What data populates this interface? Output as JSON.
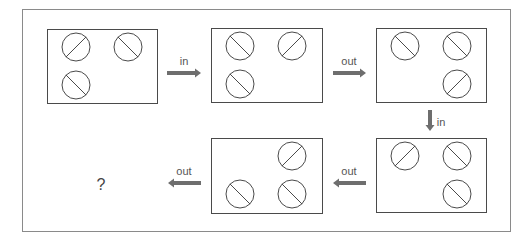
{
  "puzzle": {
    "panels": [
      {
        "id": "panel-1",
        "slots": {
          "tl": "/",
          "tr": "\\",
          "bl": "\\"
        }
      },
      {
        "id": "panel-2",
        "slots": {
          "tl": "\\",
          "tr": "/",
          "bl": "\\"
        }
      },
      {
        "id": "panel-3",
        "slots": {
          "tl": "\\",
          "tr": "\\",
          "br": "/"
        }
      },
      {
        "id": "panel-4",
        "slots": {
          "tl": "/",
          "tr": "\\",
          "br": "\\"
        }
      },
      {
        "id": "panel-5",
        "slots": {
          "tr": "/",
          "bl": "\\",
          "br": "\\"
        }
      }
    ],
    "arrows": [
      {
        "from": "panel-1",
        "to": "panel-2",
        "label": "in",
        "direction": "right"
      },
      {
        "from": "panel-2",
        "to": "panel-3",
        "label": "out",
        "direction": "right"
      },
      {
        "from": "panel-3",
        "to": "panel-4",
        "label": "in",
        "direction": "down"
      },
      {
        "from": "panel-4",
        "to": "panel-5",
        "label": "out",
        "direction": "left"
      },
      {
        "from": "panel-5",
        "to": "answer",
        "label": "out",
        "direction": "left"
      }
    ],
    "answer_placeholder": "?",
    "colors": {
      "stroke": "#4a4a4a",
      "arrow": "#6e6e6e",
      "frame": "#8a8a8a"
    }
  }
}
